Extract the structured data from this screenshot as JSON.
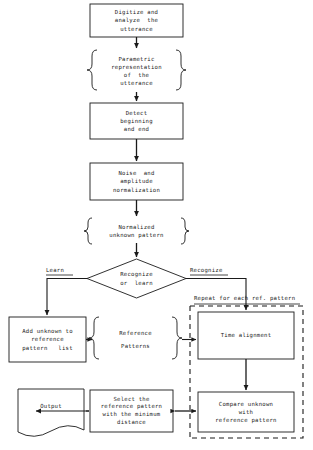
{
  "diagram": {
    "ink_color": "#1a1a1a",
    "background_color": "#ffffff"
  },
  "nodes": {
    "digitize": {
      "shape": "process",
      "lines": [
        "Digitize and",
        "analyze  the",
        "utterance"
      ]
    },
    "parametric": {
      "shape": "braces",
      "lines": [
        "Parametric",
        "representation",
        "of  the",
        "utterance"
      ]
    },
    "detect": {
      "shape": "process",
      "lines": [
        "Detect",
        "beginning",
        "and end"
      ]
    },
    "noise": {
      "shape": "process",
      "lines": [
        "Noise  and",
        "amplitude",
        "normalization"
      ]
    },
    "normalized": {
      "shape": "braces",
      "lines": [
        "Normalized",
        "unknown pattern"
      ]
    },
    "decision": {
      "shape": "diamond",
      "lines": [
        "Recognize",
        "or  learn"
      ]
    },
    "add_unknown": {
      "shape": "process",
      "lines": [
        "Add unknown to",
        "reference",
        "pattern   list"
      ]
    },
    "reference_patterns": {
      "shape": "braces",
      "lines": [
        "Reference",
        "Patterns"
      ]
    },
    "time_alignment": {
      "shape": "process",
      "lines": [
        "Time alignment"
      ]
    },
    "compare": {
      "shape": "process",
      "lines": [
        "Compare unknown",
        "with",
        "reference pattern"
      ]
    },
    "select": {
      "shape": "process",
      "lines": [
        "Select the",
        "reference pattern",
        "with the minimum",
        "distance"
      ]
    },
    "output": {
      "shape": "document",
      "lines": [
        "Output"
      ]
    }
  },
  "edge_labels": {
    "learn": "Learn",
    "recognize": "Recognize",
    "repeat": "Repeat for each ref. pattern"
  }
}
